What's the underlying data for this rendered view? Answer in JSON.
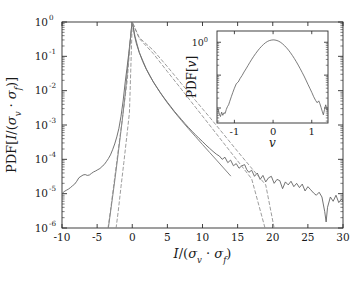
{
  "figure": {
    "background": "#ffffff",
    "line_color": "#5a5a5a",
    "dash_color": "#7d7d7d",
    "axis_color": "#2b2b2b"
  },
  "main_axes": {
    "xlabel_parts": {
      "numerator": "I",
      "denom_sigma1": "σ",
      "denom_sub1": "v",
      "dot": "·",
      "denom_sigma2": "σ",
      "denom_sub2": "f"
    },
    "xlabel_text": "I/(σv · σf)",
    "ylabel_text": "PDF[I/(σv · σf)]",
    "xticks": [
      -10,
      -5,
      0,
      5,
      10,
      15,
      20,
      25,
      30
    ],
    "xticklabels": [
      "-10",
      "-5",
      "0",
      "5",
      "10",
      "15",
      "20",
      "25",
      "30"
    ],
    "yticklabels": [
      "10",
      "10",
      "10",
      "10",
      "10",
      "10",
      "10"
    ],
    "yexponents": [
      "0",
      "-1",
      "-2",
      "-3",
      "-4",
      "-5",
      "-6"
    ]
  },
  "inset_axes": {
    "xlabel_text": "v",
    "ylabel_text": "PDF[v]",
    "xticks": [
      -1,
      0,
      1
    ],
    "xticklabels": [
      "-1",
      "0",
      "1"
    ],
    "ytick_mantissa": "10",
    "ytick_exponent": "0"
  },
  "chart_data": {
    "type": "line",
    "title": "",
    "xlabel": "I/(σ_v · σ_f)",
    "ylabel": "PDF[I/(σ_v · σ_f)]",
    "xlim": [
      -10,
      30
    ],
    "ylim": [
      1e-06,
      1
    ],
    "yscale": "log",
    "xscale": "linear",
    "grid": false,
    "legend": false,
    "series": [
      {
        "name": "measured PDF",
        "style": "solid",
        "color": "#5a5a5a",
        "x": [
          -10.0,
          -9.7,
          -9.4,
          -9.1,
          -8.8,
          -8.5,
          -8.2,
          -7.9,
          -7.6,
          -7.3,
          -7.0,
          -6.7,
          -6.4,
          -6.1,
          -5.8,
          -5.5,
          -5.2,
          -4.9,
          -4.6,
          -4.3,
          -4.0,
          -3.7,
          -3.4,
          -3.1,
          -2.8,
          -2.5,
          -2.2,
          -1.9,
          -1.6,
          -1.3,
          -1.0,
          -0.75,
          -0.5,
          -0.3,
          -0.15,
          -0.05,
          0.0,
          0.1,
          0.3,
          0.6,
          1.0,
          1.5,
          2.0,
          2.5,
          3.0,
          3.5,
          4.0,
          4.5,
          5.0,
          5.5,
          6.0,
          6.5,
          7.0,
          7.5,
          8.0,
          8.5,
          9.0,
          9.5,
          10.0,
          10.5,
          11.0,
          11.5,
          12.0,
          12.4,
          12.8,
          13.2,
          13.6,
          14.0,
          14.4,
          14.8,
          15.2,
          15.6,
          16.0,
          16.3,
          16.6,
          17.0,
          17.4,
          17.8,
          18.2,
          18.6,
          19.0,
          19.4,
          19.8,
          20.2,
          20.6,
          21.0,
          21.4,
          21.8,
          22.2,
          22.6,
          23.0,
          23.4,
          23.8,
          24.2,
          24.6,
          25.0,
          25.4,
          25.8,
          26.2,
          26.6,
          27.0,
          27.4,
          27.6,
          27.8,
          28.2,
          28.6,
          29.0,
          29.4,
          29.8,
          30.0
        ],
        "y": [
          1e-05,
          1.15e-05,
          1.25e-05,
          1.35e-05,
          1.5e-05,
          1.7e-05,
          1.9e-05,
          2.3e-05,
          2.9e-05,
          3.2e-05,
          3.5e-05,
          3.6e-05,
          3.4e-05,
          3.5e-05,
          3.9e-05,
          4.3e-05,
          4.6e-05,
          5e-05,
          5.4e-05,
          6.2e-05,
          7e-05,
          8.5e-05,
          0.000105,
          0.000135,
          0.00019,
          0.00028,
          0.00045,
          0.0008,
          0.0018,
          0.005,
          0.018,
          0.045,
          0.12,
          0.28,
          0.55,
          0.9,
          1.0,
          0.8,
          0.42,
          0.23,
          0.13,
          0.07,
          0.042,
          0.027,
          0.018,
          0.0125,
          0.0088,
          0.0063,
          0.0046,
          0.0034,
          0.0025,
          0.0019,
          0.00145,
          0.0011,
          0.00085,
          0.00066,
          0.00052,
          0.00041,
          0.00033,
          0.00026,
          0.00021,
          0.00017,
          0.00014,
          0.000125,
          0.0001,
          0.000115,
          8e-05,
          9.5e-05,
          6.5e-05,
          7.5e-05,
          5.5e-05,
          6.5e-05,
          7e-05,
          5e-05,
          4.2e-05,
          4.8e-05,
          3.2e-05,
          4e-05,
          2.6e-05,
          3.4e-05,
          2.2e-05,
          2.9e-05,
          3.2e-05,
          2e-05,
          2.6e-05,
          2.4e-05,
          1.4e-05,
          2.2e-05,
          1.8e-05,
          2.3e-05,
          1.6e-05,
          2e-05,
          1.5e-05,
          1.9e-05,
          1.2e-05,
          1.6e-05,
          1.3e-05,
          1.05e-05,
          9e-06,
          1.1e-05,
          8e-06,
          3e-06,
          1.5e-06,
          4e-06,
          8e-06,
          6e-06,
          9e-06,
          5.5e-06,
          7e-06,
          6e-06
        ]
      },
      {
        "name": "fit curve 2",
        "style": "solid",
        "color": "#6e6e6e",
        "x": [
          -3.4,
          -3.0,
          -2.6,
          -2.2,
          -1.8,
          -1.4,
          -1.0,
          -0.6,
          -0.3,
          -0.1,
          0.0,
          0.4,
          1.0,
          2.0,
          3.0,
          4.0,
          5.0,
          6.0,
          7.0,
          8.0,
          9.0,
          10.0,
          11.0,
          12.0,
          13.0,
          14.0
        ],
        "y": [
          1e-06,
          4e-06,
          1.6e-05,
          7e-05,
          0.00032,
          0.0015,
          0.008,
          0.06,
          0.26,
          0.7,
          1.0,
          0.38,
          0.13,
          0.043,
          0.018,
          0.0086,
          0.0044,
          0.0024,
          0.00135,
          0.00078,
          0.00046,
          0.00027,
          0.00016,
          9.5e-05,
          5.6e-05,
          3.3e-05
        ]
      },
      {
        "name": "exponential fit A (dashed)",
        "style": "dashed",
        "color": "#8a8a8a",
        "x": [
          -2.3,
          -2.0,
          -1.6,
          -1.2,
          -0.8,
          -0.4,
          0.0,
          1.0,
          3.0,
          5.0,
          7.0,
          9.0,
          11.0,
          13.0,
          15.0,
          17.0,
          19.0,
          20.2
        ],
        "y": [
          1e-06,
          3e-06,
          1.6e-05,
          8e-05,
          0.00042,
          0.0023,
          1.0,
          0.35,
          0.15,
          0.05,
          0.016,
          0.0052,
          0.0017,
          0.00054,
          0.00017,
          5.5e-05,
          1.8e-05,
          1e-06
        ]
      },
      {
        "name": "exponential fit B (dashed)",
        "style": "dashed",
        "color": "#8a8a8a",
        "x": [
          -3.45,
          -3.1,
          -2.7,
          -2.3,
          -1.9,
          -1.5,
          -1.1,
          -0.7,
          -0.3,
          0.0,
          1.0,
          3.0,
          5.0,
          7.0,
          9.0,
          11.0,
          13.0,
          15.0,
          17.0,
          18.9
        ],
        "y": [
          1e-06,
          3.2e-06,
          1.4e-05,
          6e-05,
          0.00026,
          0.0011,
          0.0048,
          0.021,
          0.26,
          1.0,
          0.33,
          0.12,
          0.036,
          0.011,
          0.0033,
          0.001,
          0.0003,
          9e-05,
          2.7e-05,
          1e-06
        ]
      }
    ],
    "inset": {
      "type": "line",
      "xlabel": "v",
      "ylabel": "PDF[v]",
      "xlim": [
        -1.45,
        1.42
      ],
      "ylim": [
        0.0035,
        2.2
      ],
      "yscale": "log",
      "xticks": [
        -1,
        0,
        1
      ],
      "ytick_values": [
        1.0
      ],
      "ytick_labels": [
        "10^0"
      ],
      "series": [
        {
          "name": "velocity PDF",
          "style": "solid",
          "color": "#5a5a5a",
          "x": [
            -1.42,
            -1.39,
            -1.36,
            -1.33,
            -1.3,
            -1.27,
            -1.24,
            -1.21,
            -1.18,
            -1.15,
            -1.12,
            -1.08,
            -1.04,
            -1.0,
            -0.95,
            -0.9,
            -0.85,
            -0.8,
            -0.75,
            -0.7,
            -0.65,
            -0.6,
            -0.55,
            -0.5,
            -0.45,
            -0.4,
            -0.35,
            -0.3,
            -0.25,
            -0.2,
            -0.15,
            -0.1,
            -0.05,
            0.0,
            0.05,
            0.1,
            0.15,
            0.2,
            0.25,
            0.3,
            0.35,
            0.4,
            0.45,
            0.5,
            0.55,
            0.6,
            0.65,
            0.7,
            0.75,
            0.8,
            0.85,
            0.9,
            0.95,
            1.0,
            1.05,
            1.1,
            1.14,
            1.18,
            1.21,
            1.24,
            1.27,
            1.3,
            1.33,
            1.36,
            1.38,
            1.4
          ],
          "y": [
            0.009,
            0.0065,
            0.0055,
            0.0075,
            0.006,
            0.0072,
            0.0068,
            0.009,
            0.011,
            0.0125,
            0.016,
            0.022,
            0.03,
            0.04,
            0.055,
            0.062,
            0.08,
            0.098,
            0.125,
            0.155,
            0.195,
            0.245,
            0.305,
            0.375,
            0.455,
            0.545,
            0.645,
            0.75,
            0.855,
            0.96,
            1.05,
            1.12,
            1.16,
            1.18,
            1.17,
            1.13,
            1.07,
            0.985,
            0.885,
            0.78,
            0.675,
            0.575,
            0.48,
            0.395,
            0.32,
            0.256,
            0.202,
            0.158,
            0.122,
            0.094,
            0.071,
            0.053,
            0.04,
            0.03,
            0.022,
            0.017,
            0.0145,
            0.0165,
            0.0135,
            0.0105,
            0.008,
            0.0062,
            0.009,
            0.0125,
            0.0105,
            0.0085
          ]
        }
      ]
    }
  }
}
